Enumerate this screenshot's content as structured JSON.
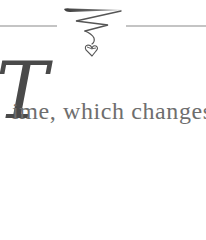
{
  "ornament": {
    "icon": "flourish-heart-ornament-icon",
    "rule_color": "#8a8a8a",
    "ink_color": "#555555"
  },
  "opening": {
    "drop_cap": "T",
    "text": "ime, which changes"
  },
  "colors": {
    "drop_cap": "#4a4a4a",
    "body_text": "#6e6e6e",
    "background": "#ffffff"
  }
}
